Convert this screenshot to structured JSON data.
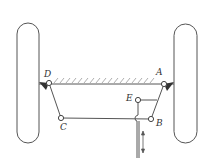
{
  "diagram": {
    "type": "steering-linkage",
    "colors": {
      "line": "#555555",
      "hatch": "#999999",
      "background": "#ffffff"
    },
    "wheels": [
      {
        "id": "left-wheel",
        "x": 17,
        "y": 23,
        "w": 22,
        "h": 120
      },
      {
        "id": "right-wheel",
        "x": 174,
        "y": 24,
        "w": 23,
        "h": 119
      }
    ],
    "joints": {
      "A": {
        "label": "A",
        "x": 164,
        "y": 84,
        "label_x": 156,
        "label_y": 68
      },
      "B": {
        "label": "B",
        "x": 151,
        "y": 119,
        "label_x": 156,
        "label_y": 119
      },
      "C": {
        "label": "C",
        "x": 61,
        "y": 118,
        "label_x": 60,
        "label_y": 123
      },
      "D": {
        "label": "D",
        "x": 49,
        "y": 83,
        "label_x": 44,
        "label_y": 70
      },
      "E": {
        "label": "E",
        "x": 138,
        "y": 100,
        "label_x": 126,
        "label_y": 94
      }
    },
    "ground_label": "fixed frame AD",
    "input_arrow": "double-headed vertical arrow (input motion)"
  }
}
